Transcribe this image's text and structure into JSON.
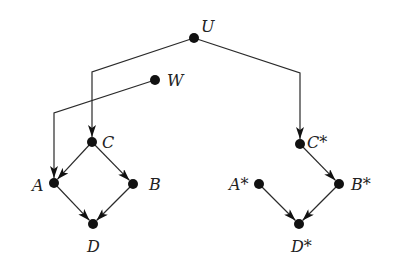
{
  "diagram": {
    "type": "directed-graph",
    "colors": {
      "edge": "#2a2a2a",
      "node": "#111111",
      "label": "#222222",
      "background": "#ffffff"
    },
    "nodes": [
      {
        "id": "U",
        "label": "U",
        "x": 194,
        "y": 38,
        "label_dx": 7,
        "label_dy": -6
      },
      {
        "id": "W",
        "label": "W",
        "x": 155,
        "y": 80,
        "label_dx": 12,
        "label_dy": 6
      },
      {
        "id": "C",
        "label": "C",
        "x": 92,
        "y": 142,
        "label_dx": 10,
        "label_dy": 6
      },
      {
        "id": "A",
        "label": "A",
        "x": 54,
        "y": 183,
        "label_dx": -22,
        "label_dy": 8
      },
      {
        "id": "B",
        "label": "B",
        "x": 133,
        "y": 184,
        "label_dx": 16,
        "label_dy": 6
      },
      {
        "id": "D",
        "label": "D",
        "x": 93,
        "y": 224,
        "label_dx": -6,
        "label_dy": 28
      },
      {
        "id": "Cs",
        "label": "C*",
        "x": 300,
        "y": 144,
        "label_dx": 7,
        "label_dy": 4
      },
      {
        "id": "As",
        "label": "A*",
        "x": 259,
        "y": 184,
        "label_dx": -30,
        "label_dy": 6
      },
      {
        "id": "Bs",
        "label": "B*",
        "x": 339,
        "y": 184,
        "label_dx": 12,
        "label_dy": 6
      },
      {
        "id": "Ds",
        "label": "D*",
        "x": 299,
        "y": 224,
        "label_dx": -8,
        "label_dy": 28
      }
    ],
    "edges": [
      {
        "from": "U",
        "to": "C",
        "points": [
          [
            194,
            38
          ],
          [
            92,
            72
          ],
          [
            92,
            142
          ]
        ]
      },
      {
        "from": "U",
        "to": "Cs",
        "points": [
          [
            194,
            38
          ],
          [
            300,
            73
          ],
          [
            300,
            144
          ]
        ]
      },
      {
        "from": "W",
        "to": "A",
        "points": [
          [
            155,
            80
          ],
          [
            54,
            113
          ],
          [
            54,
            183
          ]
        ]
      },
      {
        "from": "C",
        "to": "A",
        "points": [
          [
            92,
            142
          ],
          [
            54,
            183
          ]
        ]
      },
      {
        "from": "C",
        "to": "B",
        "points": [
          [
            92,
            142
          ],
          [
            133,
            184
          ]
        ]
      },
      {
        "from": "A",
        "to": "D",
        "points": [
          [
            54,
            183
          ],
          [
            93,
            224
          ]
        ]
      },
      {
        "from": "B",
        "to": "D",
        "points": [
          [
            133,
            184
          ],
          [
            93,
            224
          ]
        ]
      },
      {
        "from": "Cs",
        "to": "Bs",
        "points": [
          [
            300,
            144
          ],
          [
            339,
            184
          ]
        ]
      },
      {
        "from": "As",
        "to": "Ds",
        "points": [
          [
            259,
            184
          ],
          [
            299,
            224
          ]
        ]
      },
      {
        "from": "Bs",
        "to": "Ds",
        "points": [
          [
            339,
            184
          ],
          [
            299,
            224
          ]
        ]
      }
    ]
  }
}
